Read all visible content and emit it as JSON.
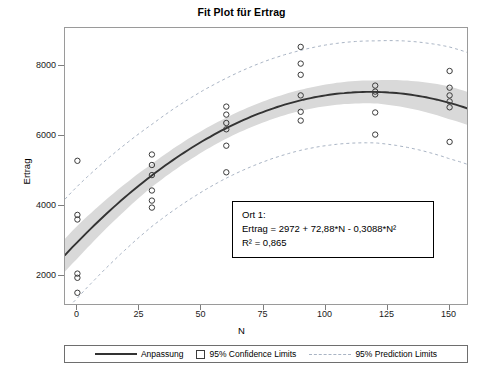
{
  "chart_data": {
    "type": "scatter",
    "title": "Fit Plot für Ertrag",
    "xlabel": "N",
    "ylabel": "Ertrag",
    "xlim": [
      -5,
      157
    ],
    "ylim": [
      1200,
      9100
    ],
    "xticks": [
      0,
      25,
      50,
      75,
      100,
      125,
      150
    ],
    "yticks": [
      2000,
      4000,
      6000,
      8000
    ],
    "grid": false,
    "legend_position": "bottom",
    "series": [
      {
        "name": "Beobachtungen",
        "type": "scatter",
        "marker": "open-circle",
        "points": [
          {
            "x": 0,
            "y": 5300
          },
          {
            "x": 0,
            "y": 3750
          },
          {
            "x": 0,
            "y": 3620
          },
          {
            "x": 0,
            "y": 2070
          },
          {
            "x": 0,
            "y": 1950
          },
          {
            "x": 0,
            "y": 1520
          },
          {
            "x": 30,
            "y": 5480
          },
          {
            "x": 30,
            "y": 5180
          },
          {
            "x": 30,
            "y": 4890
          },
          {
            "x": 30,
            "y": 4450
          },
          {
            "x": 30,
            "y": 4160
          },
          {
            "x": 30,
            "y": 3960
          },
          {
            "x": 60,
            "y": 6850
          },
          {
            "x": 60,
            "y": 6620
          },
          {
            "x": 60,
            "y": 6380
          },
          {
            "x": 60,
            "y": 6200
          },
          {
            "x": 60,
            "y": 5730
          },
          {
            "x": 60,
            "y": 4970
          },
          {
            "x": 90,
            "y": 8560
          },
          {
            "x": 90,
            "y": 8080
          },
          {
            "x": 90,
            "y": 7760
          },
          {
            "x": 90,
            "y": 7170
          },
          {
            "x": 90,
            "y": 6700
          },
          {
            "x": 90,
            "y": 6450
          },
          {
            "x": 120,
            "y": 7450
          },
          {
            "x": 120,
            "y": 7280
          },
          {
            "x": 120,
            "y": 7200
          },
          {
            "x": 120,
            "y": 6680
          },
          {
            "x": 120,
            "y": 6050
          },
          {
            "x": 150,
            "y": 7870
          },
          {
            "x": 150,
            "y": 7390
          },
          {
            "x": 150,
            "y": 7170
          },
          {
            "x": 150,
            "y": 7000
          },
          {
            "x": 150,
            "y": 6830
          },
          {
            "x": 150,
            "y": 5840
          }
        ]
      },
      {
        "name": "Anpassung",
        "type": "line",
        "model": "quadratic",
        "coefficients": {
          "intercept": 2972,
          "linear": 72.88,
          "quadratic": -0.3088
        }
      },
      {
        "name": "95% Confidence Limits",
        "type": "band",
        "style": "filled-gray",
        "half_width_at": [
          {
            "x": 0,
            "hw": 470
          },
          {
            "x": 30,
            "hw": 330
          },
          {
            "x": 60,
            "hw": 300
          },
          {
            "x": 90,
            "hw": 300
          },
          {
            "x": 120,
            "hw": 330
          },
          {
            "x": 150,
            "hw": 470
          }
        ]
      },
      {
        "name": "95% Prediction Limits",
        "type": "band",
        "style": "dashed-outline",
        "half_width_at": [
          {
            "x": 0,
            "hw": 1600
          },
          {
            "x": 30,
            "hw": 1460
          },
          {
            "x": 60,
            "hw": 1430
          },
          {
            "x": 90,
            "hw": 1430
          },
          {
            "x": 120,
            "hw": 1460
          },
          {
            "x": 150,
            "hw": 1600
          }
        ]
      }
    ],
    "annotation": {
      "line1": "Ort 1:",
      "line2": "Ertrag = 2972 + 72,88*N - 0,3088*N²",
      "line3": "R² = 0,865"
    },
    "legend": [
      {
        "label": "Anpassung",
        "marker": "solid-line",
        "color": "#333333"
      },
      {
        "label": "95% Confidence Limits",
        "marker": "square",
        "color": "#cccccc"
      },
      {
        "label": "95% Prediction Limits",
        "marker": "dashed-line",
        "color": "#a9b4c4"
      }
    ],
    "colors": {
      "fit_line": "#333333",
      "confidence_band": "#d9d9d9",
      "prediction_line": "#a9b4c4",
      "marker_edge": "#3b3b3b",
      "frame": "#9a9a9a"
    }
  }
}
